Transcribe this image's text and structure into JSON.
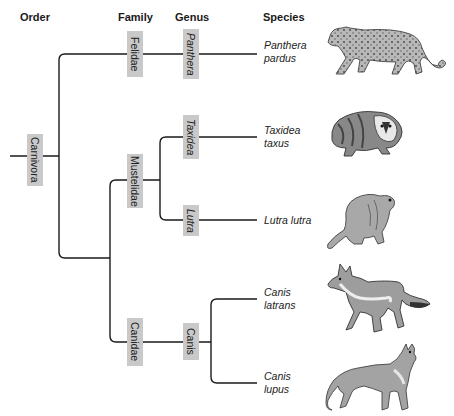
{
  "headers": {
    "order": "Order",
    "family": "Family",
    "genus": "Genus",
    "species": "Species"
  },
  "order": {
    "label": "Carnivora"
  },
  "families": [
    {
      "label": "Felidae"
    },
    {
      "label": "Mustelidae"
    },
    {
      "label": "Canidae"
    }
  ],
  "genera": [
    {
      "label": "Panthera",
      "family": "Felidae"
    },
    {
      "label": "Taxidea",
      "family": "Mustelidae"
    },
    {
      "label": "Lutra",
      "family": "Mustelidae"
    },
    {
      "label": "Canis",
      "family": "Canidae"
    }
  ],
  "species": [
    {
      "line1": "Panthera",
      "line2": "pardus",
      "animal": "leopard-icon"
    },
    {
      "line1": "Taxidea",
      "line2": "taxus",
      "animal": "badger-icon"
    },
    {
      "line1": "Lutra lutra",
      "line2": "",
      "animal": "otter-icon"
    },
    {
      "line1": "Canis",
      "line2": "latrans",
      "animal": "coyote-icon"
    },
    {
      "line1": "Canis",
      "line2": "lupus",
      "animal": "wolf-icon"
    }
  ],
  "colors": {
    "label_box": "#c9c9c9",
    "line": "#1a1a1a"
  }
}
